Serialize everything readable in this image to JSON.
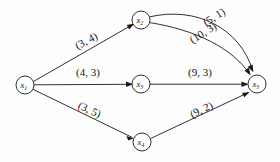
{
  "figure": {
    "type": "directed-weighted-graph",
    "background_color": "#fdfdfd",
    "ink_color": "#1a1a1a"
  },
  "nodes": [
    {
      "id": "x1",
      "label": "x",
      "subscript": "1",
      "cx": 25,
      "cy": 85,
      "r": 9
    },
    {
      "id": "x2",
      "label": "x",
      "subscript": "2",
      "cx": 141,
      "cy": 20,
      "r": 9
    },
    {
      "id": "x3",
      "label": "x",
      "subscript": "3",
      "cx": 141,
      "cy": 84,
      "r": 9
    },
    {
      "id": "x4",
      "label": "x",
      "subscript": "4",
      "cx": 142,
      "cy": 142,
      "r": 9
    },
    {
      "id": "x5",
      "label": "x",
      "subscript": "5",
      "cx": 257,
      "cy": 84,
      "r": 9
    }
  ],
  "edges": [
    {
      "id": "e-x1-x2",
      "from": "x1",
      "to": "x2",
      "label": "(3, 4)",
      "capacity": 3,
      "cost": 4,
      "label_x": 88,
      "label_y": 44,
      "label_rotation": -28,
      "curve": "straight"
    },
    {
      "id": "e-x1-x3",
      "from": "x1",
      "to": "x3",
      "label": "(4, 3)",
      "capacity": 4,
      "cost": 3,
      "label_x": 88,
      "label_y": 76,
      "label_rotation": 0,
      "curve": "straight"
    },
    {
      "id": "e-x1-x4",
      "from": "x1",
      "to": "x4",
      "label": "(3, 5)",
      "capacity": 3,
      "cost": 5,
      "label_x": 88,
      "label_y": 113,
      "label_rotation": 25,
      "curve": "straight"
    },
    {
      "id": "e-x2-x5-upper",
      "from": "x2",
      "to": "x5",
      "label": "(5, 1)",
      "capacity": 5,
      "cost": 1,
      "label_x": 216,
      "label_y": 20,
      "label_rotation": -32,
      "curve": "arc-upper"
    },
    {
      "id": "e-x2-x5-lower",
      "from": "x2",
      "to": "x5",
      "label": "(10, 3)",
      "capacity": 10,
      "cost": 3,
      "label_x": 205,
      "label_y": 36,
      "label_rotation": -32,
      "curve": "arc-lower"
    },
    {
      "id": "e-x3-x5",
      "from": "x3",
      "to": "x5",
      "label": "(9, 3)",
      "capacity": 9,
      "cost": 3,
      "label_x": 200,
      "label_y": 76,
      "label_rotation": 0,
      "curve": "straight"
    },
    {
      "id": "e-x4-x5",
      "from": "x4",
      "to": "x5",
      "label": "(9, 2)",
      "capacity": 9,
      "cost": 2,
      "label_x": 203,
      "label_y": 113,
      "label_rotation": -26,
      "curve": "straight"
    }
  ]
}
